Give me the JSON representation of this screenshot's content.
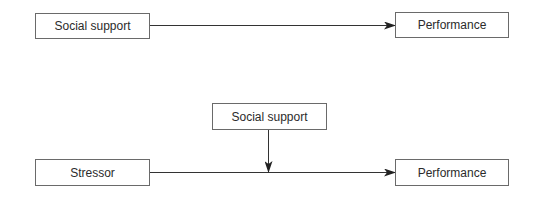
{
  "diagram": {
    "top_model": {
      "nodes": [
        {
          "id": "social_support",
          "label": "Social support"
        },
        {
          "id": "performance",
          "label": "Performance"
        }
      ],
      "edges": [
        {
          "from": "social_support",
          "to": "performance",
          "type": "direct-effect"
        }
      ]
    },
    "bottom_model": {
      "nodes": [
        {
          "id": "moderator_social_support",
          "label": "Social support"
        },
        {
          "id": "stressor",
          "label": "Stressor"
        },
        {
          "id": "performance",
          "label": "Performance"
        }
      ],
      "edges": [
        {
          "from": "stressor",
          "to": "performance",
          "type": "direct-effect"
        },
        {
          "from": "moderator_social_support",
          "to": "stressor-performance-path",
          "type": "moderation"
        }
      ]
    },
    "colors": {
      "line": "#333333",
      "box_border": "#6a6a6a",
      "text": "#2b2b2b",
      "background": "#ffffff"
    }
  }
}
